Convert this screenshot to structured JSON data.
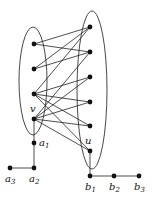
{
  "diagram": {
    "type": "graph",
    "ellipses": [
      {
        "id": "left-set",
        "cx": 33,
        "cy": 81,
        "rx": 14,
        "ry": 54
      },
      {
        "id": "right-set",
        "cx": 92,
        "cy": 90,
        "rx": 15,
        "ry": 79
      }
    ],
    "nodes": [
      {
        "id": "L1",
        "x": 34,
        "y": 44,
        "label": ""
      },
      {
        "id": "L2",
        "x": 34,
        "y": 69,
        "label": ""
      },
      {
        "id": "L3",
        "x": 34,
        "y": 94,
        "label": ""
      },
      {
        "id": "v",
        "x": 34,
        "y": 119,
        "label": "v",
        "sub": ""
      },
      {
        "id": "R1",
        "x": 90,
        "y": 27,
        "label": ""
      },
      {
        "id": "R2",
        "x": 90,
        "y": 52,
        "label": ""
      },
      {
        "id": "R3",
        "x": 90,
        "y": 77,
        "label": ""
      },
      {
        "id": "R4",
        "x": 90,
        "y": 102,
        "label": ""
      },
      {
        "id": "R5",
        "x": 90,
        "y": 126,
        "label": ""
      },
      {
        "id": "u",
        "x": 90,
        "y": 151,
        "label": "u",
        "sub": ""
      },
      {
        "id": "a1",
        "x": 34,
        "y": 143,
        "label": "a",
        "sub": "1"
      },
      {
        "id": "a2",
        "x": 34,
        "y": 168,
        "label": "a",
        "sub": "2"
      },
      {
        "id": "a3",
        "x": 10,
        "y": 168,
        "label": "a",
        "sub": "3"
      },
      {
        "id": "b1",
        "x": 90,
        "y": 176,
        "label": "b",
        "sub": "1"
      },
      {
        "id": "b2",
        "x": 114,
        "y": 176,
        "label": "b",
        "sub": "2"
      },
      {
        "id": "b3",
        "x": 139,
        "y": 176,
        "label": "b",
        "sub": "3"
      }
    ],
    "edges": [
      [
        "L1",
        "R1"
      ],
      [
        "L1",
        "R2"
      ],
      [
        "L2",
        "R1"
      ],
      [
        "L2",
        "R2"
      ],
      [
        "L3",
        "R1"
      ],
      [
        "L3",
        "R3"
      ],
      [
        "L3",
        "R4"
      ],
      [
        "L3",
        "R5"
      ],
      [
        "L3",
        "u"
      ],
      [
        "v",
        "R2"
      ],
      [
        "v",
        "R3"
      ],
      [
        "v",
        "R4"
      ],
      [
        "v",
        "R5"
      ],
      [
        "v",
        "u"
      ],
      [
        "v",
        "a1"
      ],
      [
        "a1",
        "a2"
      ],
      [
        "a2",
        "a3"
      ],
      [
        "u",
        "b1"
      ],
      [
        "b1",
        "b2"
      ],
      [
        "b2",
        "b3"
      ]
    ],
    "labels": {
      "v": "v",
      "u": "u",
      "a1": {
        "base": "a",
        "sub": "1"
      },
      "a2": {
        "base": "a",
        "sub": "2"
      },
      "a3": {
        "base": "a",
        "sub": "3"
      },
      "b1": {
        "base": "b",
        "sub": "1"
      },
      "b2": {
        "base": "b",
        "sub": "2"
      },
      "b3": {
        "base": "b",
        "sub": "3"
      }
    }
  }
}
